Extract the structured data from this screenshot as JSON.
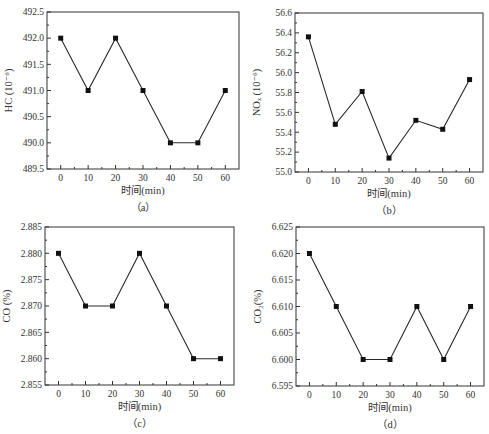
{
  "chart_data": [
    {
      "id": "a",
      "type": "line",
      "subplot_label": "（a）",
      "title": "",
      "xlabel": "时间(min)",
      "ylabel": "HC (10⁻⁶)",
      "x": [
        0,
        10,
        20,
        30,
        40,
        50,
        60
      ],
      "series": [
        {
          "name": "HC",
          "values": [
            492.0,
            491.0,
            492.0,
            491.0,
            490.0,
            490.0,
            491.0
          ]
        }
      ],
      "xlim": [
        -5,
        65
      ],
      "ylim": [
        489.5,
        492.5
      ],
      "xticks": [
        0,
        10,
        20,
        30,
        40,
        50,
        60
      ],
      "yticks": [
        489.5,
        490.0,
        490.5,
        491.0,
        491.5,
        492.0,
        492.5
      ],
      "ytick_labels": [
        "489.5",
        "490.0",
        "490.5",
        "491.0",
        "491.5",
        "492.0",
        "492.5"
      ],
      "frame": {
        "left": 47,
        "top": 12,
        "right": 239,
        "bottom": 169
      },
      "grid": false,
      "marker": "square"
    },
    {
      "id": "b",
      "type": "line",
      "subplot_label": "（b）",
      "title": "",
      "xlabel": "时间(min)",
      "ylabel": "NOₓ (10⁻⁶)",
      "x": [
        0,
        10,
        20,
        30,
        40,
        50,
        60
      ],
      "series": [
        {
          "name": "NOx",
          "values": [
            56.36,
            55.48,
            55.81,
            55.14,
            55.52,
            55.43,
            55.93
          ]
        }
      ],
      "xlim": [
        -5,
        65
      ],
      "ylim": [
        55.0,
        56.6
      ],
      "xticks": [
        0,
        10,
        20,
        30,
        40,
        50,
        60
      ],
      "yticks": [
        55.0,
        55.2,
        55.4,
        55.6,
        55.8,
        56.0,
        56.2,
        56.4,
        56.6
      ],
      "ytick_labels": [
        "55.0",
        "55.2",
        "55.4",
        "55.6",
        "55.8",
        "56.0",
        "56.2",
        "56.4",
        "56.6"
      ],
      "frame": {
        "left": 295,
        "top": 13,
        "right": 483,
        "bottom": 172
      },
      "grid": false,
      "marker": "square"
    },
    {
      "id": "c",
      "type": "line",
      "subplot_label": "（c）",
      "title": "",
      "xlabel": "时间(min)",
      "ylabel": "CO (%)",
      "x": [
        0,
        10,
        20,
        30,
        40,
        50,
        60
      ],
      "series": [
        {
          "name": "CO",
          "values": [
            2.88,
            2.87,
            2.87,
            2.88,
            2.87,
            2.86,
            2.86
          ]
        }
      ],
      "xlim": [
        -5,
        65
      ],
      "ylim": [
        2.855,
        2.885
      ],
      "xticks": [
        0,
        10,
        20,
        30,
        40,
        50,
        60
      ],
      "yticks": [
        2.855,
        2.86,
        2.865,
        2.87,
        2.875,
        2.88,
        2.885
      ],
      "ytick_labels": [
        "2.855",
        "2.860",
        "2.865",
        "2.870",
        "2.875",
        "2.880",
        "2.885"
      ],
      "frame": {
        "left": 45,
        "top": 227,
        "right": 234,
        "bottom": 385
      },
      "grid": false,
      "marker": "square"
    },
    {
      "id": "d",
      "type": "line",
      "subplot_label": "（d）",
      "title": "",
      "xlabel": "时间(min)",
      "ylabel": "CO₂(%)",
      "x": [
        0,
        10,
        20,
        30,
        40,
        50,
        60
      ],
      "series": [
        {
          "name": "CO2",
          "values": [
            6.62,
            6.61,
            6.6,
            6.6,
            6.61,
            6.6,
            6.61
          ]
        }
      ],
      "xlim": [
        -5,
        65
      ],
      "ylim": [
        6.595,
        6.625
      ],
      "xticks": [
        0,
        10,
        20,
        30,
        40,
        50,
        60
      ],
      "yticks": [
        6.595,
        6.6,
        6.605,
        6.61,
        6.615,
        6.62,
        6.625
      ],
      "ytick_labels": [
        "6.595",
        "6.600",
        "6.605",
        "6.610",
        "6.615",
        "6.620",
        "6.625"
      ],
      "frame": {
        "left": 296,
        "top": 227,
        "right": 484,
        "bottom": 386
      },
      "grid": false,
      "marker": "square"
    }
  ],
  "style": {
    "line_color": "#2a2a2a",
    "marker_color": "#111111",
    "axis_color": "#333333"
  }
}
